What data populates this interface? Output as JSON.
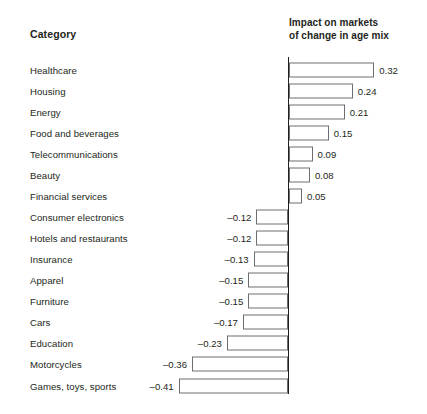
{
  "header": {
    "category_label": "Category",
    "impact_line1": "Impact on markets",
    "impact_line2": "of change in age mix"
  },
  "chart_data": {
    "type": "bar",
    "orientation": "horizontal",
    "title": "Impact on markets of change in age mix",
    "xlabel": "Impact on markets of change in age mix",
    "ylabel": "Category",
    "grid": false,
    "legend": "none",
    "zero_line": true,
    "xlim": [
      -0.45,
      0.36
    ],
    "categories": [
      "Healthcare",
      "Housing",
      "Energy",
      "Food and beverages",
      "Telecommunications",
      "Beauty",
      "Financial services",
      "Consumer electronics",
      "Hotels and restaurants",
      "Insurance",
      "Apparel",
      "Furniture",
      "Cars",
      "Education",
      "Motorcycles",
      "Games, toys, sports"
    ],
    "values": [
      0.32,
      0.24,
      0.21,
      0.15,
      0.09,
      0.08,
      0.05,
      -0.12,
      -0.12,
      -0.13,
      -0.15,
      -0.15,
      -0.17,
      -0.23,
      -0.36,
      -0.41
    ],
    "value_labels": [
      "0.32",
      "0.24",
      "0.21",
      "0.15",
      "0.09",
      "0.08",
      "0.05",
      "–0.12",
      "–0.12",
      "–0.13",
      "–0.15",
      "–0.15",
      "–0.17",
      "–0.23",
      "–0.36",
      "–0.41"
    ],
    "colors": {
      "bar_fill": "#ffffff",
      "bar_stroke": "#6d6e71",
      "axis": "#231f20",
      "text": "#231f20"
    }
  }
}
